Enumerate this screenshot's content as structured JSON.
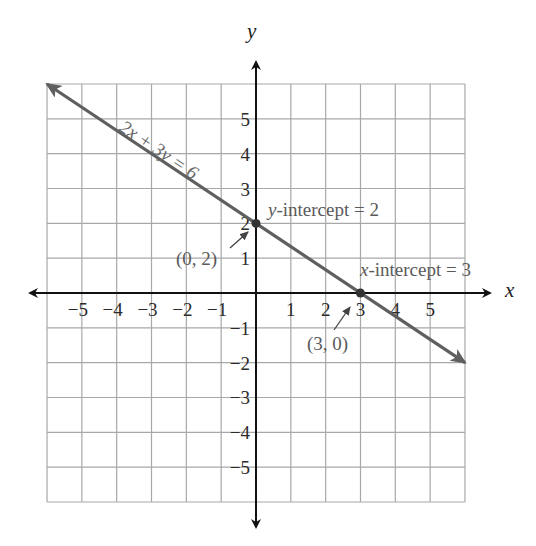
{
  "chart_data": {
    "type": "line",
    "title": "",
    "xlabel": "x",
    "ylabel": "y",
    "xlim": [
      -6,
      6
    ],
    "ylim": [
      -6,
      6
    ],
    "grid": true,
    "x_ticks": [
      "−5",
      "−4",
      "−3",
      "−2",
      "−1",
      "1",
      "2",
      "3",
      "4",
      "5"
    ],
    "y_ticks": [
      "5",
      "4",
      "3",
      "2",
      "1",
      "−1",
      "−2",
      "−3",
      "−4",
      "−5"
    ],
    "series": [
      {
        "name": "2x + 3y = 6",
        "equation": "2x + 3y = 6",
        "x": [
          -6,
          0,
          3,
          6
        ],
        "y": [
          6,
          2,
          0,
          -2
        ],
        "color": "#5f5f5f"
      }
    ],
    "points": [
      {
        "x": 0,
        "y": 2,
        "label": "(0, 2)"
      },
      {
        "x": 3,
        "y": 0,
        "label": "(3, 0)"
      }
    ],
    "annotations": {
      "line_label": "2x + 3y = 6",
      "y_intercept_label": "-intercept = 2",
      "y_intercept_var": "y",
      "x_intercept_label": "-intercept = 3",
      "x_intercept_var": "x",
      "point_a": "(0, 2)",
      "point_b": "(3, 0)"
    }
  }
}
